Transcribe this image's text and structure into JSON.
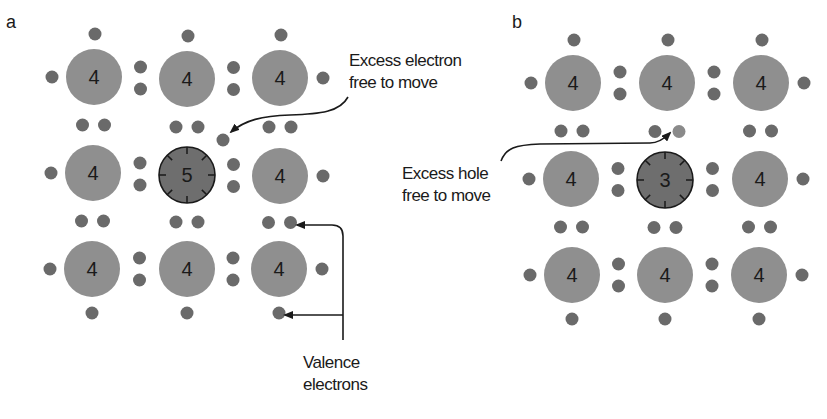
{
  "panels": [
    {
      "id": "a",
      "letter": "a",
      "type": "n-type (donor doped)",
      "atoms": [
        {
          "row": 0,
          "col": 0,
          "valence": "4",
          "x": 94,
          "y": 77
        },
        {
          "row": 0,
          "col": 1,
          "valence": "4",
          "x": 187,
          "y": 79
        },
        {
          "row": 0,
          "col": 2,
          "valence": "4",
          "x": 280,
          "y": 78
        },
        {
          "row": 1,
          "col": 0,
          "valence": "4",
          "x": 93,
          "y": 173
        },
        {
          "row": 1,
          "col": 1,
          "valence": "5",
          "x": 187,
          "y": 175,
          "impurity": true
        },
        {
          "row": 1,
          "col": 2,
          "valence": "4",
          "x": 280,
          "y": 176
        },
        {
          "row": 2,
          "col": 0,
          "valence": "4",
          "x": 92,
          "y": 269
        },
        {
          "row": 2,
          "col": 1,
          "valence": "4",
          "x": 187,
          "y": 269
        },
        {
          "row": 2,
          "col": 2,
          "valence": "4",
          "x": 279,
          "y": 269
        }
      ],
      "annotations": [
        {
          "name": "excess-electron-label",
          "lines": [
            "Excess electron",
            "free to move"
          ]
        },
        {
          "name": "valence-electrons-label",
          "lines": [
            "Valence",
            "electrons"
          ]
        }
      ]
    },
    {
      "id": "b",
      "letter": "b",
      "type": "p-type (acceptor doped)",
      "atoms": [
        {
          "row": 0,
          "col": 0,
          "valence": "4",
          "x": 573,
          "y": 83
        },
        {
          "row": 0,
          "col": 1,
          "valence": "4",
          "x": 667,
          "y": 83
        },
        {
          "row": 0,
          "col": 2,
          "valence": "4",
          "x": 761,
          "y": 83
        },
        {
          "row": 1,
          "col": 0,
          "valence": "4",
          "x": 571,
          "y": 179
        },
        {
          "row": 1,
          "col": 1,
          "valence": "3",
          "x": 665,
          "y": 180,
          "impurity": true
        },
        {
          "row": 1,
          "col": 2,
          "valence": "4",
          "x": 760,
          "y": 179
        },
        {
          "row": 2,
          "col": 0,
          "valence": "4",
          "x": 572,
          "y": 275
        },
        {
          "row": 2,
          "col": 1,
          "valence": "4",
          "x": 665,
          "y": 275
        },
        {
          "row": 2,
          "col": 2,
          "valence": "4",
          "x": 759,
          "y": 275
        }
      ],
      "annotations": [
        {
          "name": "excess-hole-label",
          "lines": [
            "Excess hole",
            "free to move"
          ]
        }
      ]
    }
  ],
  "labels": {
    "panel_a": "a",
    "panel_b": "b",
    "excess_electron_1": "Excess electron",
    "excess_electron_2": "free to move",
    "valence_1": "Valence",
    "valence_2": "electrons",
    "excess_hole_1": "Excess hole",
    "excess_hole_2": "free to move"
  },
  "colors": {
    "atom_fill": "#8f8f8f",
    "impurity_fill": "#6e6e6e",
    "electron_fill": "#6a6a6a",
    "hole_electron_fill": "#8a8a8a",
    "text": "#1a1a1a",
    "arrow": "#1a1a1a"
  }
}
